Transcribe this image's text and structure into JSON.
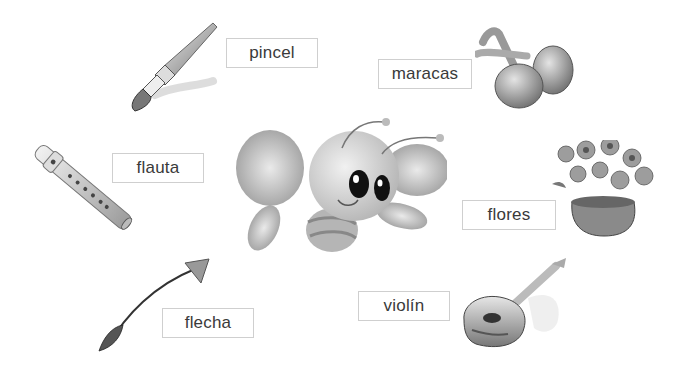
{
  "worksheet": {
    "center_character": "bee",
    "items": [
      {
        "id": "pincel",
        "label": "pincel",
        "picture": "paintbrush-icon"
      },
      {
        "id": "maracas",
        "label": "maracas",
        "picture": "maracas-icon"
      },
      {
        "id": "flauta",
        "label": "flauta",
        "picture": "flute-icon"
      },
      {
        "id": "flores",
        "label": "flores",
        "picture": "flowers-icon"
      },
      {
        "id": "flecha",
        "label": "flecha",
        "picture": "arrow-icon"
      },
      {
        "id": "violin",
        "label": "violín",
        "picture": "violin-icon"
      }
    ]
  }
}
